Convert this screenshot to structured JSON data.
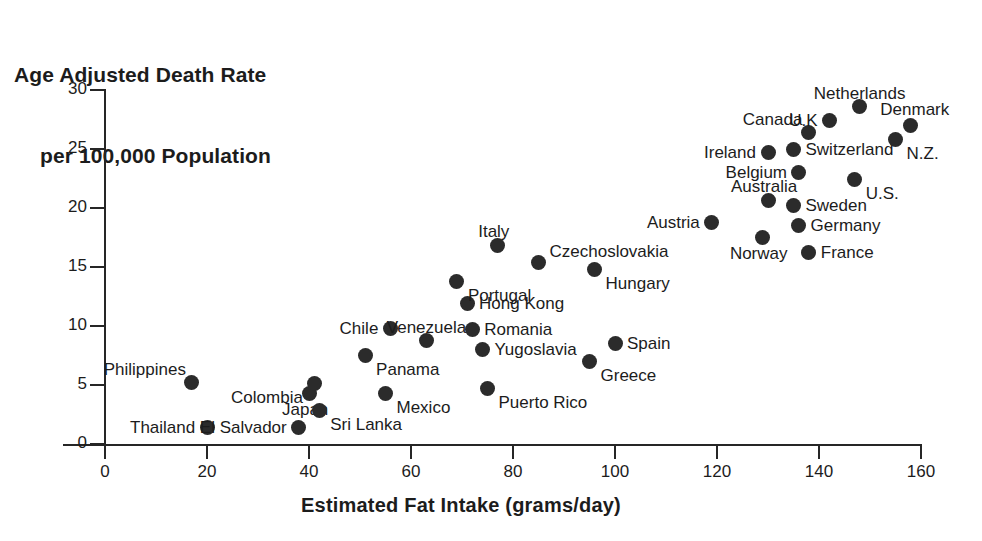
{
  "chart_data": {
    "type": "scatter",
    "title": "Age Adjusted Death Rate per 100,000 Population",
    "title_lines": [
      "Age Adjusted Death Rate",
      "per 100,000 Population"
    ],
    "xlabel": "Estimated Fat Intake (grams/day)",
    "ylabel": "Age Adjusted Death Rate per 100,000 Population",
    "xlim": [
      0,
      160
    ],
    "ylim": [
      0,
      30
    ],
    "xticks": [
      0,
      20,
      40,
      60,
      80,
      100,
      120,
      140,
      160
    ],
    "yticks": [
      0,
      5,
      10,
      15,
      20,
      25,
      30
    ],
    "grid": false,
    "legend": "none",
    "marker_color": "#2b2b2b",
    "axis_color": "#262626",
    "points": [
      {
        "label": "Philippines",
        "x": 17,
        "y": 5.2,
        "label_pos": "left-above"
      },
      {
        "label": "Thailand",
        "x": 20,
        "y": 1.4,
        "label_pos": "left"
      },
      {
        "label": "El Salvador",
        "x": 38,
        "y": 1.4,
        "label_pos": "left"
      },
      {
        "label": "Japan",
        "x": 40,
        "y": 4.3,
        "label_pos": "below-left"
      },
      {
        "label": "Colombia",
        "x": 41,
        "y": 5.1,
        "label_pos": "left-below"
      },
      {
        "label": "Sri Lanka",
        "x": 42,
        "y": 2.8,
        "label_pos": "right-below"
      },
      {
        "label": "Panama",
        "x": 51,
        "y": 7.5,
        "label_pos": "right-below"
      },
      {
        "label": "Mexico",
        "x": 55,
        "y": 4.3,
        "label_pos": "right-below"
      },
      {
        "label": "Chile",
        "x": 56,
        "y": 9.8,
        "label_pos": "left"
      },
      {
        "label": "Venezuela",
        "x": 63,
        "y": 8.8,
        "label_pos": "above"
      },
      {
        "label": "Hong Kong",
        "x": 71,
        "y": 11.9,
        "label_pos": "right"
      },
      {
        "label": "Portugal",
        "x": 69,
        "y": 13.8,
        "label_pos": "right-below"
      },
      {
        "label": "Romania",
        "x": 72,
        "y": 9.7,
        "label_pos": "right"
      },
      {
        "label": "Yugoslavia",
        "x": 74,
        "y": 8.0,
        "label_pos": "right"
      },
      {
        "label": "Puerto Rico",
        "x": 75,
        "y": 4.7,
        "label_pos": "right-below"
      },
      {
        "label": "Italy",
        "x": 77,
        "y": 16.8,
        "label_pos": "above-left"
      },
      {
        "label": "Czechoslovakia",
        "x": 85,
        "y": 15.4,
        "label_pos": "right-above"
      },
      {
        "label": "Hungary",
        "x": 96,
        "y": 14.8,
        "label_pos": "right-below"
      },
      {
        "label": "Greece",
        "x": 95,
        "y": 7.0,
        "label_pos": "right-below"
      },
      {
        "label": "Spain",
        "x": 100,
        "y": 8.5,
        "label_pos": "right"
      },
      {
        "label": "Austria",
        "x": 119,
        "y": 18.8,
        "label_pos": "left"
      },
      {
        "label": "Norway",
        "x": 129,
        "y": 17.5,
        "label_pos": "below-left"
      },
      {
        "label": "Ireland",
        "x": 130,
        "y": 24.7,
        "label_pos": "left"
      },
      {
        "label": "Australia",
        "x": 130,
        "y": 20.6,
        "label_pos": "above-left"
      },
      {
        "label": "Sweden",
        "x": 135,
        "y": 20.2,
        "label_pos": "right"
      },
      {
        "label": "Switzerland",
        "x": 135,
        "y": 25.0,
        "label_pos": "right"
      },
      {
        "label": "Belgium",
        "x": 136,
        "y": 23.0,
        "label_pos": "left"
      },
      {
        "label": "Germany",
        "x": 136,
        "y": 18.5,
        "label_pos": "right"
      },
      {
        "label": "Canada",
        "x": 138,
        "y": 26.4,
        "label_pos": "left-above"
      },
      {
        "label": "France",
        "x": 138,
        "y": 16.2,
        "label_pos": "right"
      },
      {
        "label": "U.K",
        "x": 142,
        "y": 27.4,
        "label_pos": "left"
      },
      {
        "label": "U.S.",
        "x": 147,
        "y": 22.4,
        "label_pos": "right-below"
      },
      {
        "label": "Netherlands",
        "x": 148,
        "y": 28.6,
        "label_pos": "above"
      },
      {
        "label": "N.Z.",
        "x": 155,
        "y": 25.8,
        "label_pos": "right-below"
      },
      {
        "label": "Denmark",
        "x": 158,
        "y": 27.0,
        "label_pos": "above-right"
      }
    ]
  }
}
